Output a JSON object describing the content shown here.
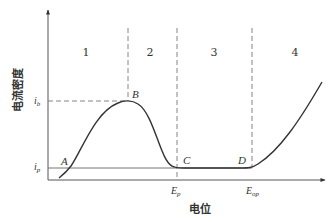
{
  "diagram": {
    "type": "anodic polarization curve",
    "y_axis_label": "电流密度",
    "x_axis_label": "电位",
    "y_ticks": [
      {
        "label": "i",
        "sub": "b",
        "y": 101
      },
      {
        "label": "i",
        "sub": "p",
        "y": 168
      }
    ],
    "x_ticks": [
      {
        "label": "E",
        "sub": "p",
        "x": 177
      },
      {
        "label": "E",
        "sub": "op",
        "x": 252
      }
    ],
    "regions": [
      {
        "label": "1",
        "x": 86
      },
      {
        "label": "2",
        "x": 150
      },
      {
        "label": "3",
        "x": 214
      },
      {
        "label": "4",
        "x": 295
      }
    ],
    "points": [
      {
        "label": "A",
        "x": 70,
        "y": 168
      },
      {
        "label": "B",
        "x": 128,
        "y": 101
      },
      {
        "label": "C",
        "x": 177,
        "y": 168
      },
      {
        "label": "D",
        "x": 252,
        "y": 168
      }
    ],
    "colors": {
      "line": "#333333",
      "dashed": "#777777",
      "text": "#333333",
      "background": "#ffffff"
    }
  }
}
